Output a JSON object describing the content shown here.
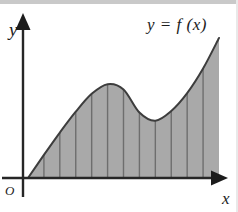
{
  "figure": {
    "title": "",
    "axis_labels": {
      "x": "x",
      "y": "y",
      "origin": "O"
    },
    "curve_label": "y = f (x)",
    "colors": {
      "fill": "#a9a9a9",
      "curve": "#3d3d3d",
      "strip_divider": "#6e6e6e",
      "axis": "#262626",
      "top_band": "#c9c9c9",
      "right_edge": "#e9e9e9",
      "background": "#ffffff"
    }
  },
  "chart_data": {
    "type": "area",
    "title": "",
    "subtitle": "",
    "xlabel": "x",
    "ylabel": "y",
    "legend": [
      "y = f (x)"
    ],
    "legend_position": "top-right",
    "grid": false,
    "axis_style": "arrowed",
    "origin_label": "O",
    "xlim": [
      0,
      12
    ],
    "ylim": [
      0,
      10
    ],
    "strip_count": 12,
    "strip_boundaries_x": [
      0,
      1,
      2,
      3,
      4,
      5,
      6,
      7,
      8,
      9,
      10,
      11,
      12
    ],
    "x": [
      0,
      1,
      2,
      3,
      4,
      5,
      6,
      7,
      8,
      9,
      10,
      11,
      12
    ],
    "values": [
      0.0,
      1.55,
      3.05,
      4.45,
      5.65,
      6.3,
      5.95,
      4.4,
      3.85,
      4.5,
      5.7,
      7.35,
      9.4
    ],
    "features": {
      "local_maximum": {
        "x": 5.0,
        "y": 6.3
      },
      "local_minimum": {
        "x": 7.45,
        "y": 3.8
      },
      "start_point": {
        "x": 0,
        "y": 0
      },
      "end_point": {
        "x": 12,
        "y": 9.4
      }
    },
    "pixel_geometry": {
      "x_axis_y": 178,
      "y_axis_x": 23,
      "plot_left": 28,
      "plot_right": 219,
      "curve_end_y": 38
    }
  }
}
